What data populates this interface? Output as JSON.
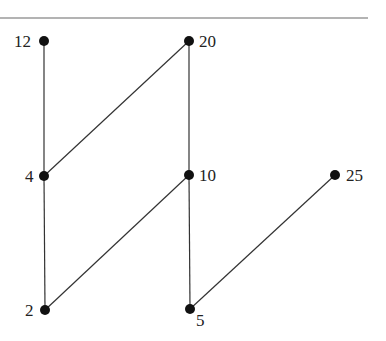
{
  "diagram": {
    "type": "hasse-diagram",
    "rule_line": {
      "x1": 0,
      "y1": 18,
      "x2": 368,
      "y2": 18,
      "color": "#9a9a9a"
    },
    "node_color": "#111111",
    "edge_color": "#333333",
    "nodes": [
      {
        "id": "n12",
        "label": "12",
        "x": 44,
        "y": 41,
        "lx": 14,
        "ly": 47,
        "anchor": "start"
      },
      {
        "id": "n20",
        "label": "20",
        "x": 189,
        "y": 41,
        "lx": 199,
        "ly": 47,
        "anchor": "start"
      },
      {
        "id": "n4",
        "label": "4",
        "x": 44,
        "y": 176,
        "lx": 25,
        "ly": 182,
        "anchor": "start"
      },
      {
        "id": "n10",
        "label": "10",
        "x": 189,
        "y": 175,
        "lx": 199,
        "ly": 181,
        "anchor": "start"
      },
      {
        "id": "n25",
        "label": "25",
        "x": 335,
        "y": 175,
        "lx": 346,
        "ly": 181,
        "anchor": "start"
      },
      {
        "id": "n2",
        "label": "2",
        "x": 45,
        "y": 310,
        "lx": 25,
        "ly": 316,
        "anchor": "start"
      },
      {
        "id": "n5",
        "label": "5",
        "x": 190,
        "y": 309,
        "lx": 196,
        "ly": 326,
        "anchor": "start"
      }
    ],
    "edges": [
      {
        "from": "n12",
        "to": "n4"
      },
      {
        "from": "n20",
        "to": "n4"
      },
      {
        "from": "n20",
        "to": "n10"
      },
      {
        "from": "n4",
        "to": "n2"
      },
      {
        "from": "n10",
        "to": "n2"
      },
      {
        "from": "n10",
        "to": "n5"
      },
      {
        "from": "n25",
        "to": "n5"
      }
    ]
  }
}
